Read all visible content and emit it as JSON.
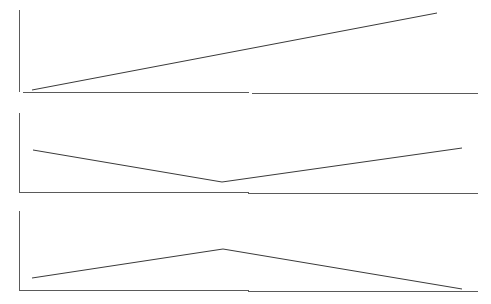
{
  "figure": {
    "title": "",
    "background_color": "#ffffff",
    "width": 491,
    "height": 304,
    "panel_count": 3
  },
  "style": {
    "axis_color": "#5a5a5a",
    "line_color": "#3a3a3a",
    "axis_stroke_width": 1,
    "line_stroke_width": 1
  },
  "chart_data": [
    {
      "type": "line",
      "panel_index": 0,
      "panel_name": "increasing-trend-panel",
      "title": "",
      "xlabel": "",
      "ylabel": "",
      "grid": false,
      "legend": null,
      "axis": {
        "x_axis": {
          "x1": 19,
          "y1": 92,
          "x2": 478,
          "y2": 94
        },
        "y_axis": {
          "x1": 19,
          "y1": 10,
          "x2": 19,
          "y2": 92
        }
      },
      "xlim": [
        0,
        100
      ],
      "ylim": [
        0,
        100
      ],
      "x": [
        3,
        100
      ],
      "values": [
        2,
        96
      ],
      "points_px": [
        [
          32,
          90
        ],
        [
          437,
          13
        ]
      ],
      "shape": "monotonic-increasing",
      "annotations": []
    },
    {
      "type": "line",
      "panel_index": 1,
      "panel_name": "v-shape-trend-panel",
      "title": "",
      "xlabel": "",
      "ylabel": "",
      "grid": false,
      "legend": null,
      "axis": {
        "x_axis": {
          "x1": 19,
          "y1": 192,
          "x2": 478,
          "y2": 194
        },
        "y_axis": {
          "x1": 19,
          "y1": 113,
          "x2": 19,
          "y2": 192
        }
      },
      "xlim": [
        0,
        100
      ],
      "ylim": [
        0,
        100
      ],
      "x": [
        3,
        44,
        100
      ],
      "values": [
        53,
        13,
        56
      ],
      "points_px": [
        [
          33,
          150
        ],
        [
          222,
          182
        ],
        [
          462,
          148
        ]
      ],
      "shape": "v-shape-decrease-then-increase",
      "annotations": []
    },
    {
      "type": "line",
      "panel_index": 2,
      "panel_name": "peak-trend-panel",
      "title": "",
      "xlabel": "",
      "ylabel": "",
      "grid": false,
      "legend": null,
      "axis": {
        "x_axis": {
          "x1": 19,
          "y1": 290,
          "x2": 478,
          "y2": 292
        },
        "y_axis": {
          "x1": 19,
          "y1": 211,
          "x2": 19,
          "y2": 290
        }
      },
      "xlim": [
        0,
        100
      ],
      "ylim": [
        0,
        100
      ],
      "x": [
        3,
        45,
        100
      ],
      "values": [
        15,
        52,
        1
      ],
      "points_px": [
        [
          32,
          278
        ],
        [
          223,
          249
        ],
        [
          462,
          289
        ]
      ],
      "shape": "inverted-v-increase-then-decrease",
      "annotations": []
    }
  ]
}
